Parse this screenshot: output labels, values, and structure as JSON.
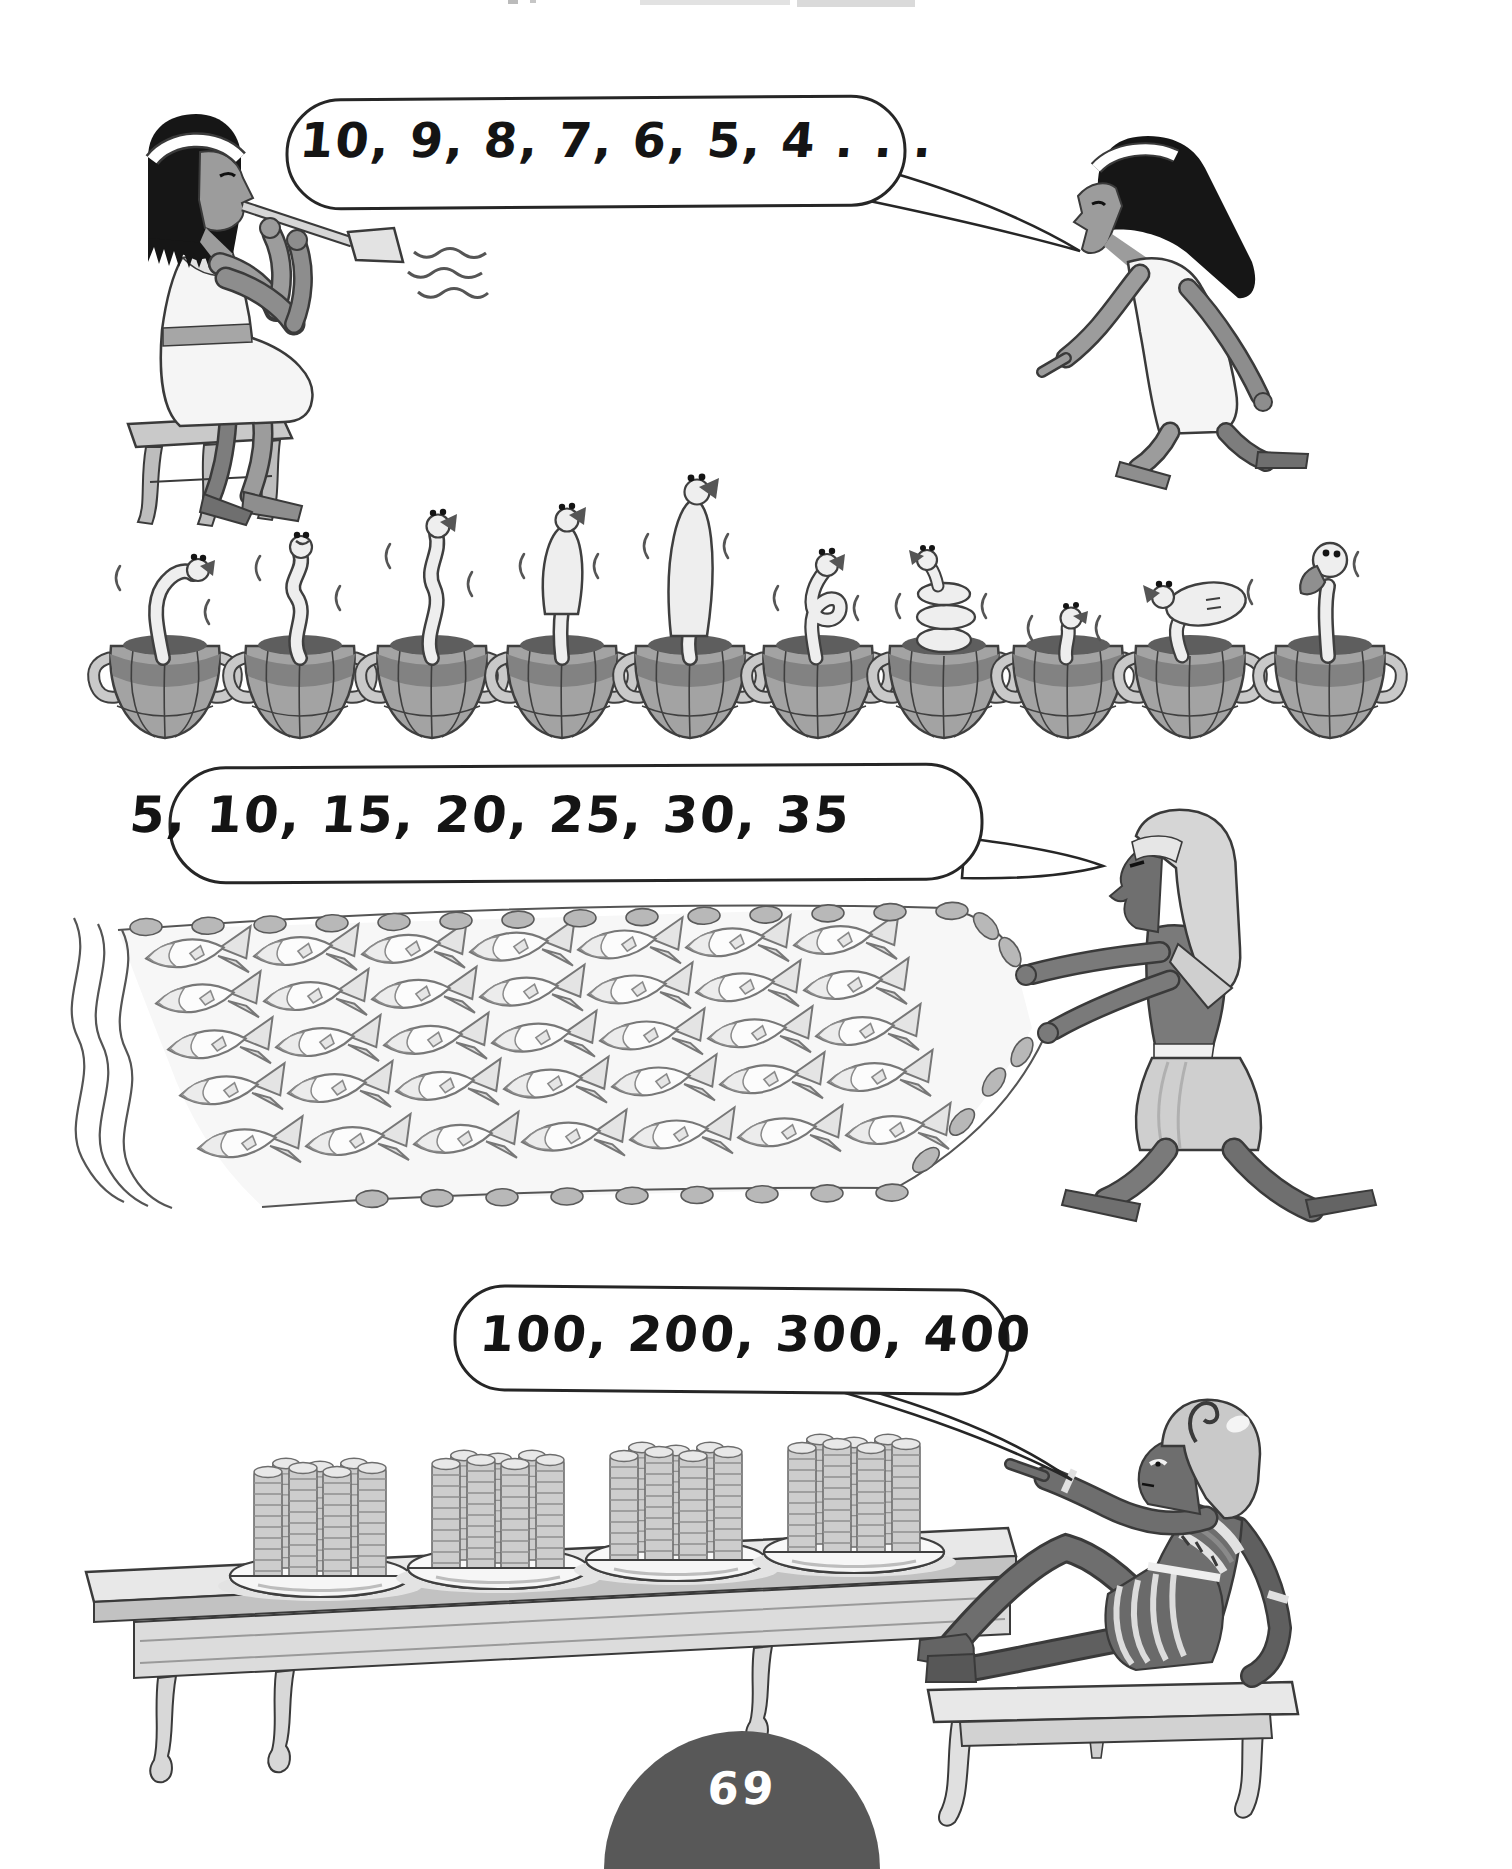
{
  "page": {
    "number": "69",
    "background_color": "#ffffff",
    "ink_color": "#303030",
    "page_number_badge_color": "#585858",
    "page_number_text_color": "#ffffff"
  },
  "scenes": [
    {
      "name": "snake-charmer-countdown",
      "speech_bubble_text": "10, 9, 8, 7, 6, 5, 4 . . .",
      "speaker": "counting-woman",
      "characters": [
        "flute-player",
        "counting-woman"
      ],
      "snake_basket_count": 10,
      "count_sequence": [
        10,
        9,
        8,
        7,
        6,
        5,
        4
      ]
    },
    {
      "name": "fish-net-count-by-fives",
      "speech_bubble_text": "5, 10, 15, 20, 25, 30, 35",
      "speaker": "fisherman",
      "characters": [
        "fisherman"
      ],
      "fish_rows": 5,
      "fish_per_row": 7,
      "fish_total": 35,
      "count_sequence": [
        5,
        10,
        15,
        20,
        25,
        30,
        35
      ]
    },
    {
      "name": "coin-stacks-count-by-hundreds",
      "speech_bubble_text": "100, 200, 300, 400",
      "speaker": "reclining-pharaoh",
      "characters": [
        "reclining-pharaoh"
      ],
      "plate_count": 4,
      "stacks_per_plate": 7,
      "coins_per_stack": 10,
      "count_sequence": [
        100,
        200,
        300,
        400
      ]
    }
  ]
}
